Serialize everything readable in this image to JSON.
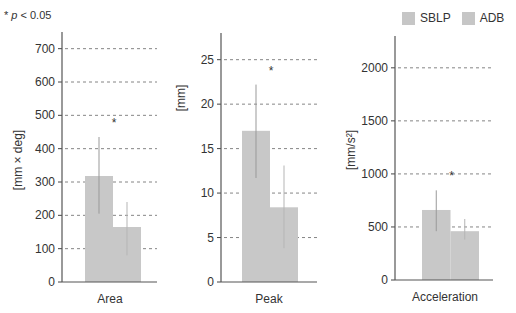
{
  "note": {
    "star": "*",
    "p": "p",
    "text": " < 0.05"
  },
  "legend": [
    {
      "label": "SBLP",
      "color": "#c6c6c6"
    },
    {
      "label": "ADB",
      "color": "#c6c6c6"
    }
  ],
  "chart_data": [
    {
      "type": "bar",
      "title": "",
      "xlabel": "Area",
      "ylabel": "[mm × deg]",
      "categories": [
        "Area"
      ],
      "series": [
        {
          "name": "SBLP",
          "values": [
            318
          ],
          "error_low": [
            205
          ],
          "error_high": [
            435
          ]
        },
        {
          "name": "ADB",
          "values": [
            165
          ],
          "error_low": [
            80
          ],
          "error_high": [
            240
          ]
        }
      ],
      "ylim": [
        0,
        750
      ],
      "yticks": [
        0,
        100,
        200,
        300,
        400,
        500,
        600,
        700
      ],
      "grid": "dashed horizontal",
      "annotation": "*",
      "legend_position": "top-right"
    },
    {
      "type": "bar",
      "title": "",
      "xlabel": "Peak",
      "ylabel": "[mm]",
      "categories": [
        "Peak"
      ],
      "series": [
        {
          "name": "SBLP",
          "values": [
            17.0
          ],
          "error_low": [
            11.7
          ],
          "error_high": [
            22.2
          ]
        },
        {
          "name": "ADB",
          "values": [
            8.4
          ],
          "error_low": [
            3.8
          ],
          "error_high": [
            13.1
          ]
        }
      ],
      "ylim": [
        0,
        28
      ],
      "yticks": [
        0,
        5,
        10,
        15,
        20,
        25
      ],
      "grid": "dashed horizontal",
      "annotation": "*"
    },
    {
      "type": "bar",
      "title": "",
      "xlabel": "Acceleration",
      "ylabel": "[mm/s²]",
      "categories": [
        "Acceleration"
      ],
      "series": [
        {
          "name": "SBLP",
          "values": [
            660
          ],
          "error_low": [
            460
          ],
          "error_high": [
            845
          ]
        },
        {
          "name": "ADB",
          "values": [
            460
          ],
          "error_low": [
            380
          ],
          "error_high": [
            575
          ]
        }
      ],
      "ylim": [
        0,
        2300
      ],
      "yticks": [
        0,
        500,
        1000,
        1500,
        2000
      ],
      "grid": "dashed horizontal",
      "annotation": "*"
    }
  ]
}
